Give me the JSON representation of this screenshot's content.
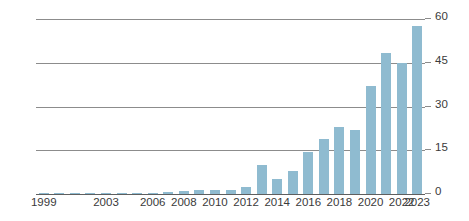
{
  "chart_data": {
    "type": "bar",
    "title": "",
    "subtitle": "",
    "xlabel": "",
    "ylabel": "",
    "grid": true,
    "legend": "none",
    "bar_color": "#8fbbd0",
    "gridline_color": "#8c8c8c",
    "axis_label_color": "#3a3a3a",
    "ylim": [
      0,
      60
    ],
    "yticks": [
      0,
      15,
      30,
      45,
      60
    ],
    "ytick_labels": [
      "0",
      "15",
      "30",
      "45",
      "60"
    ],
    "xtick_labels": [
      "1999",
      "2003",
      "2006",
      "2008",
      "2010",
      "2012",
      "2014",
      "2016",
      "2018",
      "2020",
      "2022",
      "2023"
    ],
    "categories": [
      "1999",
      "2000",
      "2001",
      "2002",
      "2003",
      "2004",
      "2005",
      "2006",
      "2007",
      "2008",
      "2009",
      "2010",
      "2011",
      "2012",
      "2013",
      "2014",
      "2015",
      "2016",
      "2017",
      "2018",
      "2019",
      "2020",
      "2021",
      "2022",
      "2023"
    ],
    "values": [
      0.5,
      0.3,
      0.3,
      0.3,
      0.4,
      0.3,
      0.3,
      0.4,
      0.8,
      1.2,
      1.3,
      1.4,
      1.5,
      2.3,
      10,
      5,
      8,
      14.5,
      19,
      23,
      22,
      37,
      48.5,
      45,
      57.5
    ]
  }
}
